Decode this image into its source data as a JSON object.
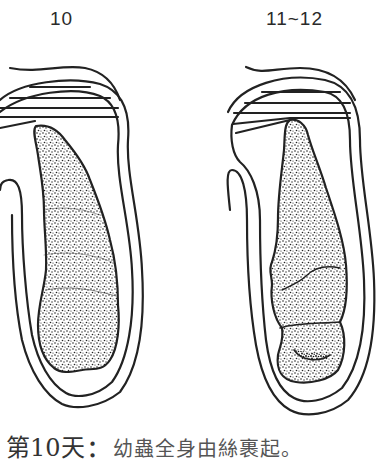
{
  "figure": {
    "stages": [
      {
        "label": "10"
      },
      {
        "label": "11~12"
      }
    ]
  },
  "caption": {
    "day": "第10天",
    "separator": "：",
    "description": "幼蟲全身由絲裹起。"
  },
  "colors": {
    "ink": "#222222",
    "background": "#ffffff"
  }
}
